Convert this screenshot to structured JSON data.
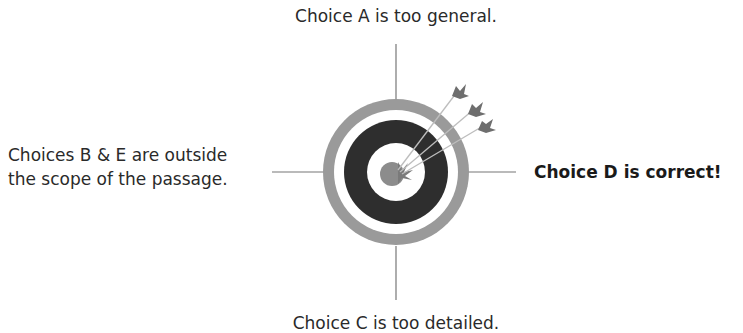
{
  "diagram": {
    "type": "target-answer-choices",
    "labels": {
      "top": "Choice A is too general.",
      "left_line1": "Choices B & E are outside",
      "left_line2": "the scope of the passage.",
      "right": "Choice D is correct!",
      "bottom": "Choice C is too detailed."
    },
    "colors": {
      "outer_ring": "#9a9a9a",
      "dark_ring": "#2e2e2e",
      "bullseye": "#8c8c8c",
      "arrow": "#6e6e6e",
      "line": "#777777",
      "background": "#ffffff"
    },
    "icons": {
      "target": "bullseye-target-icon",
      "arrows": "arrow-icon"
    }
  }
}
